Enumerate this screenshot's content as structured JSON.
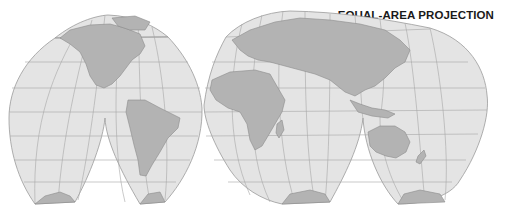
{
  "title": "EQUAL-AREA PROJECTION",
  "map": {
    "projection": "interrupted equal-area (homolosine)",
    "lobes": [
      "north-america",
      "eurasia",
      "south-pacific",
      "south-america",
      "africa",
      "australasia"
    ],
    "continents": [
      "North America",
      "South America",
      "Europe",
      "Asia",
      "Africa",
      "Australia",
      "Antarctica"
    ],
    "colors": {
      "ocean": "#e4e4e4",
      "land": "#b3b3b3",
      "grid": "#a6a6a6",
      "outline": "#9a9a9a",
      "title": "#1a1a1a"
    }
  }
}
